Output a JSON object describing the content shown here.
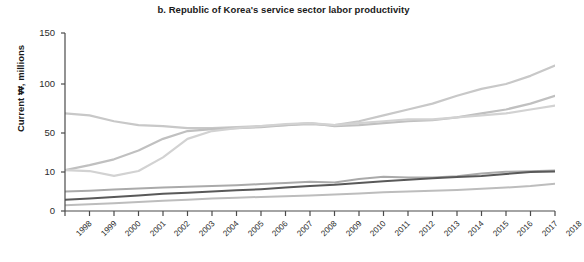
{
  "chart_data": {
    "type": "line",
    "title": "b. Republic of Korea's service sector labor productivity",
    "xlabel": "",
    "ylabel": "Current ₩, millions",
    "x": [
      1998,
      1999,
      2000,
      2001,
      2002,
      2003,
      2004,
      2005,
      2006,
      2007,
      2008,
      2009,
      2010,
      2011,
      2012,
      2013,
      2014,
      2015,
      2016,
      2017,
      2018
    ],
    "ytick_labels": [
      "0",
      "10",
      "50",
      "100",
      "150"
    ],
    "ytick_values": [
      0,
      10,
      50,
      100,
      150
    ],
    "ylim": [
      0,
      150
    ],
    "yscale": "nonlinear-compressed",
    "grid": false,
    "legend": "none",
    "series": [
      {
        "name": "series-1",
        "color": "#c8c8c8",
        "width": 2.2,
        "values": [
          70,
          68,
          62,
          58,
          57,
          55,
          55,
          56,
          57,
          58,
          59,
          58,
          62,
          68,
          74,
          80,
          88,
          95,
          100,
          108,
          118
        ]
      },
      {
        "name": "series-2",
        "color": "#c0c0c0",
        "width": 2.2,
        "values": [
          12,
          17,
          23,
          32,
          44,
          52,
          54,
          55,
          56,
          58,
          60,
          57,
          58,
          60,
          62,
          63,
          66,
          70,
          74,
          80,
          88
        ]
      },
      {
        "name": "series-3",
        "color": "#d2d2d2",
        "width": 2.2,
        "values": [
          12,
          11,
          9,
          11,
          25,
          44,
          52,
          55,
          57,
          59,
          60,
          58,
          60,
          62,
          64,
          64,
          66,
          68,
          70,
          74,
          78
        ]
      },
      {
        "name": "series-4",
        "color": "#aaaaaa",
        "width": 2.0,
        "values": [
          5.0,
          5.2,
          5.5,
          5.8,
          6.0,
          6.2,
          6.4,
          6.6,
          6.9,
          7.2,
          7.5,
          7.3,
          8.2,
          8.8,
          8.6,
          8.6,
          8.9,
          9.6,
          10.2,
          10.8,
          11.6
        ]
      },
      {
        "name": "series-5",
        "color": "#595959",
        "width": 2.0,
        "values": [
          2.9,
          3.2,
          3.6,
          4.0,
          4.4,
          4.7,
          5.0,
          5.3,
          5.6,
          6.0,
          6.4,
          6.7,
          7.2,
          7.6,
          8.0,
          8.4,
          8.7,
          9.0,
          9.5,
          10.0,
          10.6
        ]
      },
      {
        "name": "series-6",
        "color": "#bdbdbd",
        "width": 2.0,
        "values": [
          1.5,
          1.7,
          2.0,
          2.3,
          2.6,
          2.9,
          3.2,
          3.4,
          3.6,
          3.8,
          4.0,
          4.2,
          4.5,
          4.8,
          5.0,
          5.2,
          5.4,
          5.7,
          6.0,
          6.4,
          7.0
        ]
      }
    ]
  },
  "axis": {
    "xticks": [
      "1998",
      "1999",
      "2000",
      "2001",
      "2002",
      "2003",
      "2004",
      "2005",
      "2006",
      "2007",
      "2008",
      "2009",
      "2010",
      "2011",
      "2012",
      "2013",
      "2014",
      "2015",
      "2016",
      "2017",
      "2018"
    ]
  },
  "colors": {
    "axis": "#4a4a4a",
    "text": "#1a1a1a",
    "background": "#ffffff"
  }
}
